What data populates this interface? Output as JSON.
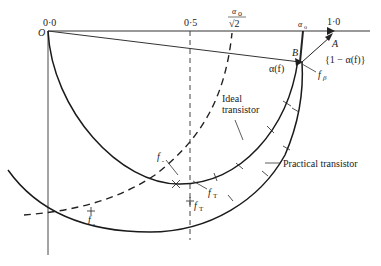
{
  "figure": {
    "axis_labels": {
      "origin_value": "0·0",
      "origin_point": "O",
      "half": "0·5",
      "alpha_over_root2_num": "α",
      "alpha_over_root2_sub": "o",
      "alpha_over_root2_den": "√2",
      "alpha0": "α",
      "alpha0_sub": "o",
      "one": "1·0"
    },
    "points": {
      "A": "A",
      "B": "B"
    },
    "vector_labels": {
      "alpha_f": "α(f)",
      "one_minus_alpha": "{1 − α(f)}"
    },
    "frequency_labels": {
      "f_beta": "f",
      "f_beta_sub": "β",
      "f_alpha_ideal": "f",
      "f_alpha_ideal_sub": "ₐ",
      "f_T_ideal": "f",
      "f_T_ideal_sub": "T",
      "f_alpha_practical": "f",
      "f_alpha_practical_sub": "ₐ",
      "f_T_practical": "f",
      "f_T_practical_sub": "T"
    },
    "curve_labels": {
      "ideal_line1": "Ideal",
      "ideal_line2": "transistor",
      "practical": "Practical transistor"
    },
    "colors": {
      "ink": "#222222",
      "background": "#ffffff"
    }
  }
}
